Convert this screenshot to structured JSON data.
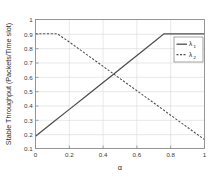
{
  "figure": {
    "background_color": "#ffffff",
    "axes_color": "#808080",
    "grid_color": "#d9d9d9",
    "line_color": "#4d4d4d"
  },
  "caption": {
    "text": ""
  },
  "chart_data": {
    "type": "line",
    "title": "",
    "subtitle": "",
    "xlabel": "α",
    "ylabel": "Stable Throughput (Packets/Time slot)",
    "xlim": [
      0,
      1
    ],
    "ylim": [
      0.1,
      1
    ],
    "grid": true,
    "legend_position": "upper right inside",
    "xticks": [
      0,
      0.2,
      0.4,
      0.6,
      0.8,
      1
    ],
    "xticklabels": [
      "0",
      "0.2",
      "0.4",
      "0.6",
      "0.8",
      "1"
    ],
    "yticks": [
      0.1,
      0.2,
      0.3,
      0.4,
      0.5,
      0.6,
      0.7,
      0.8,
      0.9,
      1
    ],
    "yticklabels": [
      "0.1",
      "0.2",
      "0.3",
      "0.4",
      "0.5",
      "0.6",
      "0.7",
      "0.8",
      "0.9",
      "1"
    ],
    "annotations": [],
    "series": [
      {
        "name": "λ",
        "subscript": "1",
        "style": "solid",
        "color": "#4d4d4d",
        "x": [
          0,
          0.1,
          0.2,
          0.3,
          0.4,
          0.46,
          0.5,
          0.6,
          0.7,
          0.76,
          0.8,
          0.9,
          1
        ],
        "values": [
          0.185,
          0.279,
          0.373,
          0.467,
          0.561,
          0.617,
          0.655,
          0.749,
          0.843,
          0.9,
          0.9,
          0.9,
          0.9
        ]
      },
      {
        "name": "λ",
        "subscript": "2",
        "style": "dashed",
        "color": "#4d4d4d",
        "x": [
          0,
          0.05,
          0.13,
          0.2,
          0.3,
          0.4,
          0.46,
          0.5,
          0.6,
          0.7,
          0.8,
          0.9,
          1
        ],
        "values": [
          0.9,
          0.9,
          0.9,
          0.843,
          0.758,
          0.673,
          0.622,
          0.588,
          0.503,
          0.418,
          0.332,
          0.247,
          0.162
        ]
      }
    ]
  },
  "legend": {
    "entries": [
      {
        "symbol": "λ",
        "subscript": "1",
        "style": "solid"
      },
      {
        "symbol": "λ",
        "subscript": "2",
        "style": "dashed"
      }
    ]
  }
}
